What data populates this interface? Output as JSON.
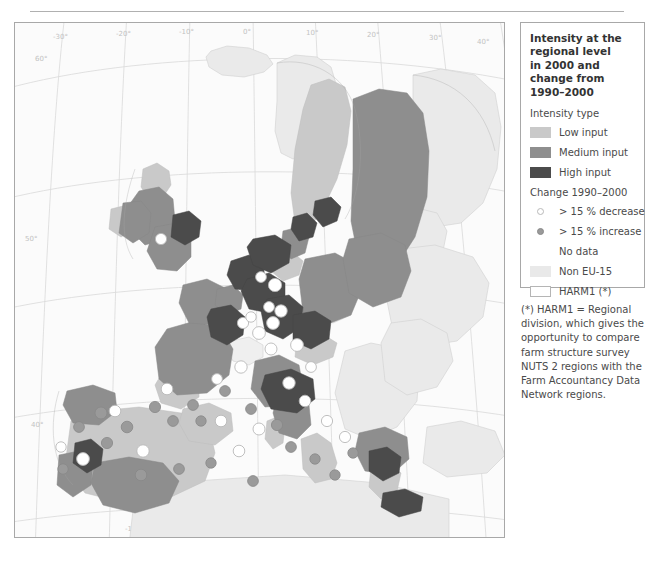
{
  "legend": {
    "title": "Intensity at the\nregional level\nin 2000 and\nchange from\n1990–2000",
    "intensity_heading": "Intensity type",
    "intensity_items": [
      {
        "label": "Low input",
        "color": "#c9c9c9",
        "swatch": "low-input-swatch"
      },
      {
        "label": "Medium input",
        "color": "#8e8e8e",
        "swatch": "medium-input-swatch"
      },
      {
        "label": "High input",
        "color": "#4b4b4b",
        "swatch": "high-input-swatch"
      }
    ],
    "change_heading": "Change 1990–2000",
    "change_items": [
      {
        "label": "> 15 % decrease",
        "marker": "decrease-marker",
        "color": "#ffffff"
      },
      {
        "label": "> 15 % increase",
        "marker": "increase-marker",
        "color": "#9a9a9a"
      }
    ],
    "other_items": [
      {
        "label": "No data",
        "color": "transparent",
        "swatch": "no-data-swatch"
      },
      {
        "label": "Non EU-15",
        "color": "#e9e9e9",
        "swatch": "non-eu15-swatch"
      },
      {
        "label": "HARM1 (*)",
        "color": "#ffffff",
        "swatch": "harm1-swatch"
      }
    ]
  },
  "footnote": {
    "text": "(*) HARM1 = Regional\ndivision, which gives the\nopportunity to compare\nfarm structure survey\nNUTS 2 regions with the\nFarm Accountancy Data\nNetwork regions."
  },
  "map": {
    "graticule_labels": {
      "top": [
        "-30°",
        "-20°",
        "-10°",
        "0°",
        "10°",
        "20°",
        "30°",
        "40°",
        "50°"
      ],
      "bottom": [
        "-10°",
        "0°",
        "10°",
        "20°",
        "30°"
      ],
      "left": [
        "60°",
        "50°",
        "40°"
      ],
      "right": [
        "60°",
        "50°",
        "40°"
      ]
    },
    "colors": {
      "low_input": "#c9c9c9",
      "medium_input": "#8e8e8e",
      "high_input": "#4b4b4b",
      "non_eu15": "#e9e9e9",
      "no_data": "#fbfbfb",
      "background": "#fbfbfb",
      "graticule": "#d8d8d8",
      "border": "#a8a8a8",
      "coastline": "#9a9a9a",
      "decrease_marker": "#ffffff",
      "increase_marker": "#9a9a9a"
    }
  }
}
